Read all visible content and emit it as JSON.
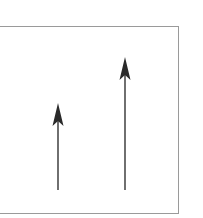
{
  "diagram": {
    "frame": {
      "left": -2,
      "top": 26,
      "right": 179,
      "bottom": 214,
      "stroke": "#9a9a9a"
    },
    "arrows": [
      {
        "name": "shorter-vector",
        "x": 58,
        "base_y": 190,
        "tip_y": 103,
        "color": "#333333"
      },
      {
        "name": "taller-vector",
        "x": 125,
        "base_y": 190,
        "tip_y": 57,
        "color": "#333333"
      }
    ]
  }
}
